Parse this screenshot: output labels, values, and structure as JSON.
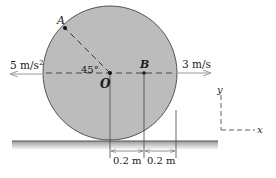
{
  "diagram": {
    "type": "rolling-disk-kinematics",
    "colors": {
      "disk_fill": "#bcbcbc",
      "disk_edge": "#555555",
      "ink": "#1a1a1a",
      "arrow": "#9a9a9a",
      "ground": "#7a7a7a"
    },
    "points": {
      "A": "A",
      "O": "O",
      "B": "B"
    },
    "angle_label": "45°",
    "acceleration_label": "5 m/s",
    "acceleration_exp": "2",
    "velocity_label": "3 m/s",
    "dimensions": [
      "0.2 m",
      "0.2 m"
    ],
    "axes": {
      "x": "x",
      "y": "y"
    }
  }
}
